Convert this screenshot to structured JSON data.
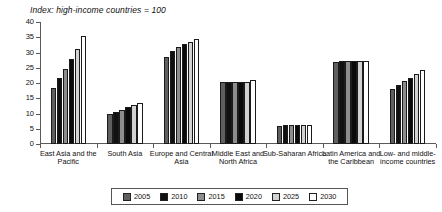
{
  "chart_data": {
    "type": "bar",
    "title": "Index: high-income countries = 100",
    "xlabel": "",
    "ylabel": "",
    "ylim": [
      0,
      40
    ],
    "yticks": [
      0,
      5,
      10,
      15,
      20,
      25,
      30,
      35,
      40
    ],
    "grid": false,
    "legend_position": "bottom",
    "categories": [
      "East Asia and the Pacific",
      "South Asia",
      "Europe and Central Asia",
      "Middle East and North Africa",
      "Sub-Saharan Africa",
      "Latin America and the Caribbean",
      "Low- and middle-income countries"
    ],
    "series": [
      {
        "name": "2005",
        "color": "#5f5f5f",
        "values": [
          18.3,
          9.7,
          28.4,
          20.2,
          6.0,
          27.0,
          17.9
        ]
      },
      {
        "name": "2010",
        "color": "#111111",
        "values": [
          21.6,
          10.6,
          30.5,
          20.2,
          6.1,
          27.1,
          19.3
        ]
      },
      {
        "name": "2015",
        "color": "#8d8d8d",
        "values": [
          24.6,
          11.3,
          31.8,
          20.2,
          6.1,
          27.1,
          20.5
        ]
      },
      {
        "name": "2020",
        "color": "#0a0a0a",
        "values": [
          27.8,
          12.2,
          32.7,
          20.2,
          6.2,
          27.2,
          21.8
        ]
      },
      {
        "name": "2025",
        "color": "#d2d2d2",
        "values": [
          31.2,
          12.7,
          33.4,
          20.3,
          6.3,
          27.2,
          22.9
        ]
      },
      {
        "name": "2030",
        "color": "#ffffff",
        "values": [
          35.3,
          13.5,
          34.5,
          21.0,
          6.3,
          27.3,
          24.2
        ]
      }
    ]
  },
  "legend": {
    "items": [
      {
        "label": "2005"
      },
      {
        "label": "2010"
      },
      {
        "label": "2015"
      },
      {
        "label": "2020"
      },
      {
        "label": "2025"
      },
      {
        "label": "2030"
      }
    ]
  }
}
